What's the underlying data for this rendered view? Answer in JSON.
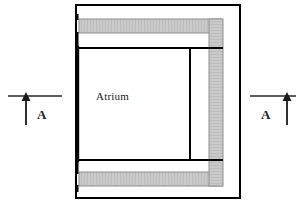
{
  "drawing": {
    "type": "architectural-floor-plan",
    "title": "",
    "background_color": "#ffffff",
    "line_color": "#000000",
    "hatch_fill_color": "#c9c9c9",
    "hatch_stroke_color": "#9a9a9a",
    "labels": {
      "atrium": "Atrium",
      "section_marker_left": "A",
      "section_marker_right": "A"
    },
    "outer_wall": {
      "name": "building-outline",
      "x": 76,
      "y": 5,
      "width": 164,
      "height": 193,
      "stroke_width": 2
    },
    "inner_room": {
      "name": "atrium-outline",
      "x": 77,
      "y": 48,
      "width": 113,
      "height": 112,
      "stroke_width": 2
    },
    "inner_divider": {
      "name": "corridor-divider",
      "x": 190,
      "y1": 48,
      "y2": 160,
      "stroke_width": 2
    },
    "hatched_bands": [
      {
        "name": "top-glazing-band",
        "orientation": "horizontal",
        "x": 79,
        "y": 19,
        "width": 143,
        "height": 14
      },
      {
        "name": "bottom-glazing-band",
        "orientation": "horizontal",
        "x": 79,
        "y": 172,
        "width": 143,
        "height": 14
      },
      {
        "name": "right-vertical-glazing-band",
        "orientation": "vertical",
        "x": 209,
        "y": 19,
        "width": 14,
        "height": 167
      }
    ],
    "section_markers": [
      {
        "name": "section-marker-left",
        "label": "A",
        "line_x1": 8,
        "line_x2": 62,
        "line_y": 96,
        "arrow_x": 26,
        "arrow_top": 96,
        "arrow_bottom": 125,
        "direction": "up",
        "label_x": 37,
        "label_y": 108
      },
      {
        "name": "section-marker-right",
        "label": "A",
        "line_x1": 250,
        "line_x2": 296,
        "line_y": 96,
        "arrow_x": 287,
        "arrow_top": 96,
        "arrow_bottom": 125,
        "direction": "up",
        "label_x": 261,
        "label_y": 108
      }
    ]
  }
}
